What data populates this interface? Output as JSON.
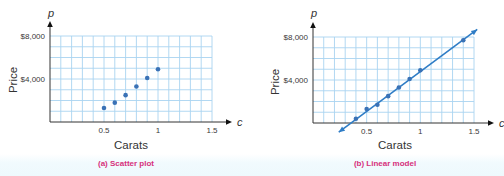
{
  "colors": {
    "grid": "#a9d4f0",
    "axis": "#333333",
    "point": "#3a72b6",
    "line": "#2f7dc6",
    "caption": "#d6307c"
  },
  "chart_data": [
    {
      "id": "a",
      "type": "scatter",
      "title": "(a) Scatter plot",
      "caption": "(a) Scatter plot",
      "xlabel": "Carats",
      "ylabel": "Price",
      "x_var": "c",
      "y_var": "p",
      "xlim": [
        0,
        1.5
      ],
      "ylim": [
        0,
        8000
      ],
      "x_ticks": [
        0.5,
        1,
        1.5
      ],
      "x_tick_labels": [
        "0.5",
        "1",
        "1.5"
      ],
      "y_ticks": [
        4000,
        8000
      ],
      "y_tick_labels": [
        "$4,000",
        "$8,000"
      ],
      "grid": true,
      "grid_step_x": 0.1,
      "grid_step_y": 1000,
      "legend": null,
      "series": [
        {
          "name": "Diamond prices",
          "points": [
            {
              "x": 0.5,
              "y": 1300
            },
            {
              "x": 0.6,
              "y": 1800
            },
            {
              "x": 0.7,
              "y": 2500
            },
            {
              "x": 0.8,
              "y": 3300
            },
            {
              "x": 0.9,
              "y": 4100
            },
            {
              "x": 1.0,
              "y": 4900
            }
          ]
        }
      ]
    },
    {
      "id": "b",
      "type": "scatter",
      "title": "(b) Linear model",
      "caption": "(b) Linear model",
      "xlabel": "Carats",
      "ylabel": "Price",
      "x_var": "c",
      "y_var": "p",
      "xlim": [
        0,
        1.5
      ],
      "ylim": [
        0,
        8000
      ],
      "x_ticks": [
        0.5,
        1,
        1.5
      ],
      "x_tick_labels": [
        "0.5",
        "1",
        "1.5"
      ],
      "y_ticks": [
        4000,
        8000
      ],
      "y_tick_labels": [
        "$4,000",
        "$8,000"
      ],
      "grid": true,
      "grid_step_x": 0.1,
      "grid_step_y": 1000,
      "legend": null,
      "series": [
        {
          "name": "Diamond prices",
          "points": [
            {
              "x": 0.4,
              "y": 400
            },
            {
              "x": 0.5,
              "y": 1300
            },
            {
              "x": 0.6,
              "y": 1700
            },
            {
              "x": 0.7,
              "y": 2500
            },
            {
              "x": 0.8,
              "y": 3300
            },
            {
              "x": 0.9,
              "y": 4100
            },
            {
              "x": 1.0,
              "y": 4900
            },
            {
              "x": 1.4,
              "y": 7700
            }
          ]
        }
      ],
      "fit_line": {
        "type": "linear",
        "from": {
          "x": 0.24,
          "y": -850
        },
        "to": {
          "x": 1.53,
          "y": 8700
        },
        "arrows": "both"
      }
    }
  ],
  "layout": [
    {
      "x0": 50,
      "x1": 212,
      "y0": 122,
      "y1": 36,
      "ylabel_x": 13,
      "ylabel_y": 80,
      "xlabel_x": 131,
      "caption_x": 126,
      "axis_end_x": 232,
      "c_label_x": 237,
      "axis_top_y": 21,
      "p_label_y": 14
    },
    {
      "x0": 313,
      "x1": 474,
      "y0": 123,
      "y1": 37,
      "ylabel_x": 275,
      "ylabel_y": 82,
      "xlabel_x": 395,
      "caption_x": 385,
      "axis_end_x": 494,
      "c_label_x": 499,
      "axis_top_y": 22,
      "p_label_y": 14
    }
  ]
}
